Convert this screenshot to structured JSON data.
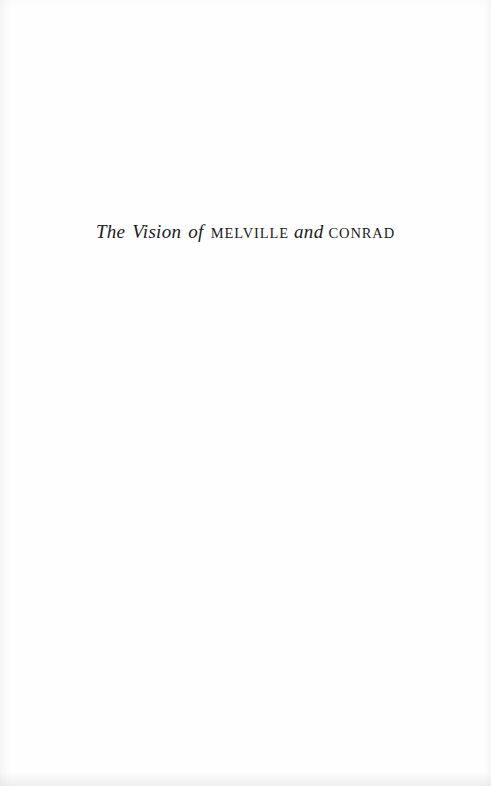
{
  "page": {
    "type": "book-half-title-page",
    "background_color": "#fefefe",
    "ink_color": "#1b1b20"
  },
  "halftitle": {
    "full_text": "The Vision of MELVILLE and CONRAD",
    "segments": [
      {
        "text": "The",
        "style": "italic"
      },
      {
        "text": "Vision",
        "style": "italic"
      },
      {
        "text": "of",
        "style": "italic"
      },
      {
        "text": "MELVILLE",
        "style": "small-caps"
      },
      {
        "text": "and",
        "style": "italic"
      },
      {
        "text": "CONRAD",
        "style": "small-caps"
      }
    ]
  }
}
